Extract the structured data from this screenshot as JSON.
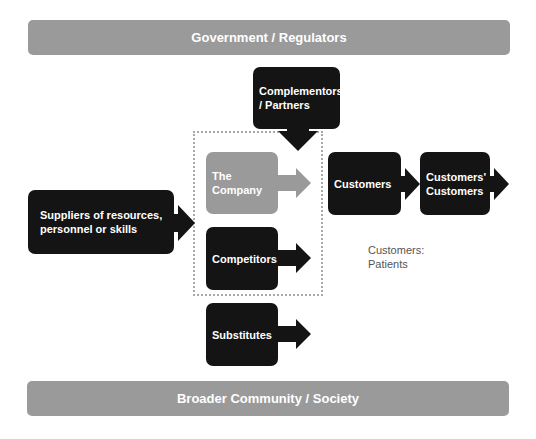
{
  "diagram": {
    "top_banner": {
      "label": "Government / Regulators"
    },
    "bottom_banner": {
      "label": "Broader Community / Society"
    },
    "nodes": {
      "complementors": {
        "label": "Complementors\n/ Partners",
        "style": "dark",
        "arrow": "down"
      },
      "company": {
        "label": "The Company",
        "style": "light",
        "arrow": "right"
      },
      "competitors": {
        "label": "Competitors",
        "style": "dark",
        "arrow": "right"
      },
      "substitutes": {
        "label": "Substitutes",
        "style": "dark",
        "arrow": "right"
      },
      "suppliers": {
        "label": "Suppliers of resources,\npersonnel or skills",
        "style": "dark",
        "arrow": "right"
      },
      "customers": {
        "label": "Customers",
        "style": "dark",
        "arrow": "right"
      },
      "customers_customers": {
        "label": "Customers'\nCustomers",
        "style": "dark",
        "arrow": "right"
      }
    },
    "note": {
      "label": "Customers:\nPatients"
    },
    "colors": {
      "dark": "#141414",
      "light": "#9a9a9a",
      "dotted_border": "#a8a8a8",
      "text_on_box": "#ffffff"
    }
  }
}
